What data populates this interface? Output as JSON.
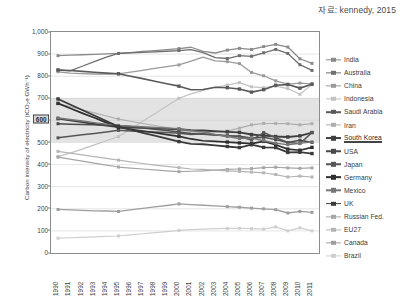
{
  "source_caption": "자료: kennedy, 2015",
  "chart_data": {
    "type": "line",
    "title": "",
    "xlabel": "",
    "ylabel": "Carbon intensity of electricity (tCO₂e GWh⁻¹)",
    "x": [
      1990,
      1991,
      1992,
      1993,
      1994,
      1995,
      1996,
      1997,
      1998,
      1999,
      2000,
      2001,
      2002,
      2003,
      2004,
      2005,
      2006,
      2007,
      2008,
      2009,
      2010,
      2011
    ],
    "xlim": [
      1990,
      2011
    ],
    "ylim": [
      0,
      1000
    ],
    "yticks": [
      0,
      100,
      200,
      300,
      400,
      500,
      600,
      700,
      800,
      900,
      1000
    ],
    "ytick_labels": [
      "0",
      "100",
      "200",
      "300",
      "400",
      "500",
      "600",
      "700",
      "800",
      "900",
      "1,000"
    ],
    "xtick_labels": [
      "1990",
      "1991",
      "1992",
      "1993",
      "1994",
      "1995",
      "1996",
      "1997",
      "1998",
      "1999",
      "2000",
      "2001",
      "2002",
      "2003",
      "2004",
      "2005",
      "2006",
      "2007",
      "2008",
      "2009",
      "2010",
      "2011"
    ],
    "grid": true,
    "legend_position": "right",
    "highlight_band": {
      "from": 500,
      "to": 700,
      "color": "#e3e3e3"
    },
    "emphasis": {
      "ytick_boxed": "600",
      "series_underlined": "South Korea"
    },
    "series": [
      {
        "name": "India",
        "color": "#8b8b8b",
        "width": 1.3,
        "values": [
          893,
          895,
          897,
          899,
          901,
          903,
          907,
          912,
          916,
          920,
          925,
          931,
          912,
          905,
          918,
          926,
          921,
          934,
          944,
          932,
          879,
          858
        ]
      },
      {
        "name": "Australia",
        "color": "#6f6f6f",
        "width": 1.3,
        "values": [
          828,
          824,
          845,
          866,
          886,
          903,
          906,
          908,
          910,
          913,
          916,
          920,
          907,
          884,
          880,
          893,
          890,
          906,
          921,
          903,
          852,
          826
        ]
      },
      {
        "name": "China",
        "color": "#9a9a9a",
        "width": 1.3,
        "values": [
          820,
          814,
          812,
          810,
          810,
          811,
          818,
          826,
          835,
          843,
          851,
          868,
          886,
          869,
          866,
          857,
          817,
          802,
          779,
          764,
          769,
          765
        ]
      },
      {
        "name": "Indonesia",
        "color": "#c2c2c2",
        "width": 1.2,
        "values": [
          436,
          452,
          470,
          489,
          508,
          527,
          560,
          596,
          630,
          665,
          700,
          720,
          736,
          750,
          760,
          771,
          752,
          748,
          755,
          744,
          718,
          762
        ]
      },
      {
        "name": "Saudi Arabia",
        "color": "#5a5a5a",
        "width": 1.6,
        "values": [
          828,
          826,
          822,
          818,
          814,
          811,
          800,
          789,
          777,
          766,
          755,
          739,
          740,
          750,
          748,
          742,
          728,
          739,
          759,
          762,
          746,
          764
        ]
      },
      {
        "name": "Iran",
        "color": "#aeaeae",
        "width": 1.2,
        "values": [
          676,
          662,
          648,
          634,
          620,
          606,
          596,
          586,
          577,
          568,
          559,
          548,
          545,
          549,
          552,
          565,
          580,
          586,
          586,
          585,
          580,
          585
        ]
      },
      {
        "name": "South Korea",
        "color": "#3f3f3f",
        "width": 1.9,
        "values": [
          608,
          600,
          592,
          584,
          577,
          570,
          568,
          566,
          564,
          562,
          560,
          556,
          554,
          551,
          548,
          546,
          536,
          531,
          527,
          525,
          530,
          545
        ]
      },
      {
        "name": "USA",
        "color": "#4a4a4a",
        "width": 1.5,
        "values": [
          585,
          583,
          582,
          580,
          578,
          577,
          572,
          566,
          560,
          554,
          548,
          541,
          537,
          534,
          531,
          528,
          520,
          524,
          513,
          500,
          510,
          500
        ]
      },
      {
        "name": "Japan",
        "color": "#555555",
        "width": 1.5,
        "values": [
          521,
          528,
          535,
          541,
          548,
          555,
          552,
          550,
          547,
          545,
          542,
          536,
          540,
          534,
          530,
          527,
          511,
          545,
          522,
          500,
          495,
          545
        ]
      },
      {
        "name": "Germany",
        "color": "#2f2f2f",
        "width": 1.7,
        "values": [
          677,
          655,
          633,
          612,
          590,
          568,
          560,
          552,
          544,
          536,
          528,
          516,
          508,
          505,
          502,
          498,
          495,
          505,
          490,
          470,
          465,
          478
        ]
      },
      {
        "name": "Mexico",
        "color": "#767676",
        "width": 1.4,
        "values": [
          611,
          604,
          597,
          590,
          583,
          577,
          574,
          571,
          568,
          565,
          562,
          553,
          548,
          536,
          527,
          518,
          521,
          508,
          497,
          490,
          496,
          503
        ]
      },
      {
        "name": "UK",
        "color": "#3a3a3a",
        "width": 1.8,
        "values": [
          697,
          672,
          647,
          622,
          597,
          572,
          558,
          544,
          531,
          517,
          504,
          494,
          492,
          487,
          482,
          477,
          490,
          478,
          477,
          455,
          456,
          450
        ]
      },
      {
        "name": "Russian Fed.",
        "color": "#a6a6a6",
        "width": 1.2,
        "values": [
          434,
          425,
          416,
          407,
          398,
          389,
          384,
          380,
          376,
          372,
          368,
          370,
          372,
          375,
          378,
          380,
          382,
          386,
          388,
          385,
          383,
          385
        ]
      },
      {
        "name": "EU27",
        "color": "#b5b5b5",
        "width": 1.2,
        "values": [
          460,
          452,
          444,
          436,
          428,
          420,
          412,
          405,
          398,
          392,
          386,
          380,
          378,
          375,
          372,
          369,
          366,
          363,
          355,
          344,
          348,
          344
        ]
      },
      {
        "name": "Canada",
        "color": "#9e9e9e",
        "width": 1.3,
        "values": [
          197,
          195,
          193,
          191,
          190,
          188,
          195,
          202,
          209,
          215,
          222,
          219,
          216,
          213,
          210,
          207,
          203,
          200,
          196,
          181,
          188,
          184
        ]
      },
      {
        "name": "Brazil",
        "color": "#cfcfcf",
        "width": 1.2,
        "values": [
          67,
          69,
          71,
          73,
          75,
          77,
          82,
          87,
          92,
          97,
          102,
          106,
          108,
          110,
          111,
          112,
          110,
          108,
          118,
          100,
          114,
          100
        ]
      }
    ]
  },
  "legend": {
    "entries": [
      {
        "label": "India"
      },
      {
        "label": "Australia"
      },
      {
        "label": "China"
      },
      {
        "label": "Indonesia"
      },
      {
        "label": "Saudi Arabia"
      },
      {
        "label": "Iran"
      },
      {
        "label": "South Korea"
      },
      {
        "label": "USA"
      },
      {
        "label": "Japan"
      },
      {
        "label": "Germany"
      },
      {
        "label": "Mexico"
      },
      {
        "label": "UK"
      },
      {
        "label": "Russian Fed."
      },
      {
        "label": "EU27"
      },
      {
        "label": "Canada"
      },
      {
        "label": "Brazil"
      }
    ]
  }
}
